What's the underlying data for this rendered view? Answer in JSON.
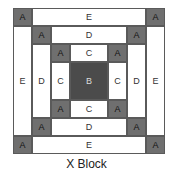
{
  "diagram": {
    "title": "X Block",
    "colors": {
      "A": "#6f6f6f",
      "B": "#4b4b4b",
      "light": "#ffffff",
      "border": "#5a5a5a"
    },
    "pieces": [
      {
        "id": "a1",
        "label": "A",
        "type": "a",
        "x": 0,
        "y": 0,
        "w": 19,
        "h": 18
      },
      {
        "id": "e-top",
        "label": "E",
        "type": "l",
        "x": 19,
        "y": 0,
        "w": 114,
        "h": 18
      },
      {
        "id": "a2",
        "label": "A",
        "type": "a",
        "x": 133,
        "y": 0,
        "w": 19,
        "h": 18
      },
      {
        "id": "e-left",
        "label": "E",
        "type": "l",
        "x": 0,
        "y": 18,
        "w": 19,
        "h": 110
      },
      {
        "id": "e-right",
        "label": "E",
        "type": "l",
        "x": 133,
        "y": 18,
        "w": 19,
        "h": 110
      },
      {
        "id": "a3",
        "label": "A",
        "type": "a",
        "x": 0,
        "y": 128,
        "w": 19,
        "h": 18
      },
      {
        "id": "e-bottom",
        "label": "E",
        "type": "l",
        "x": 19,
        "y": 128,
        "w": 114,
        "h": 18
      },
      {
        "id": "a4",
        "label": "A",
        "type": "a",
        "x": 133,
        "y": 128,
        "w": 19,
        "h": 18
      },
      {
        "id": "a5",
        "label": "A",
        "type": "a",
        "x": 19,
        "y": 18,
        "w": 19,
        "h": 18
      },
      {
        "id": "d-top",
        "label": "D",
        "type": "l",
        "x": 38,
        "y": 18,
        "w": 76,
        "h": 18
      },
      {
        "id": "a6",
        "label": "A",
        "type": "a",
        "x": 114,
        "y": 18,
        "w": 19,
        "h": 18
      },
      {
        "id": "d-left",
        "label": "D",
        "type": "l",
        "x": 19,
        "y": 36,
        "w": 19,
        "h": 74
      },
      {
        "id": "d-right",
        "label": "D",
        "type": "l",
        "x": 114,
        "y": 36,
        "w": 19,
        "h": 74
      },
      {
        "id": "a7",
        "label": "A",
        "type": "a",
        "x": 19,
        "y": 110,
        "w": 19,
        "h": 18
      },
      {
        "id": "d-bottom",
        "label": "D",
        "type": "l",
        "x": 38,
        "y": 110,
        "w": 76,
        "h": 18
      },
      {
        "id": "a8",
        "label": "A",
        "type": "a",
        "x": 114,
        "y": 110,
        "w": 19,
        "h": 18
      },
      {
        "id": "a9",
        "label": "A",
        "type": "a",
        "x": 38,
        "y": 36,
        "w": 19,
        "h": 18
      },
      {
        "id": "c-top",
        "label": "C",
        "type": "l",
        "x": 57,
        "y": 36,
        "w": 38,
        "h": 18
      },
      {
        "id": "a10",
        "label": "A",
        "type": "a",
        "x": 95,
        "y": 36,
        "w": 19,
        "h": 18
      },
      {
        "id": "c-left",
        "label": "C",
        "type": "l",
        "x": 38,
        "y": 54,
        "w": 19,
        "h": 38
      },
      {
        "id": "b-center",
        "label": "B",
        "type": "b",
        "x": 57,
        "y": 54,
        "w": 38,
        "h": 38
      },
      {
        "id": "c-right",
        "label": "C",
        "type": "l",
        "x": 95,
        "y": 54,
        "w": 19,
        "h": 38
      },
      {
        "id": "a11",
        "label": "A",
        "type": "a",
        "x": 38,
        "y": 92,
        "w": 19,
        "h": 18
      },
      {
        "id": "c-bottom",
        "label": "C",
        "type": "l",
        "x": 57,
        "y": 92,
        "w": 38,
        "h": 18
      },
      {
        "id": "a12",
        "label": "A",
        "type": "a",
        "x": 95,
        "y": 92,
        "w": 19,
        "h": 18
      }
    ]
  }
}
